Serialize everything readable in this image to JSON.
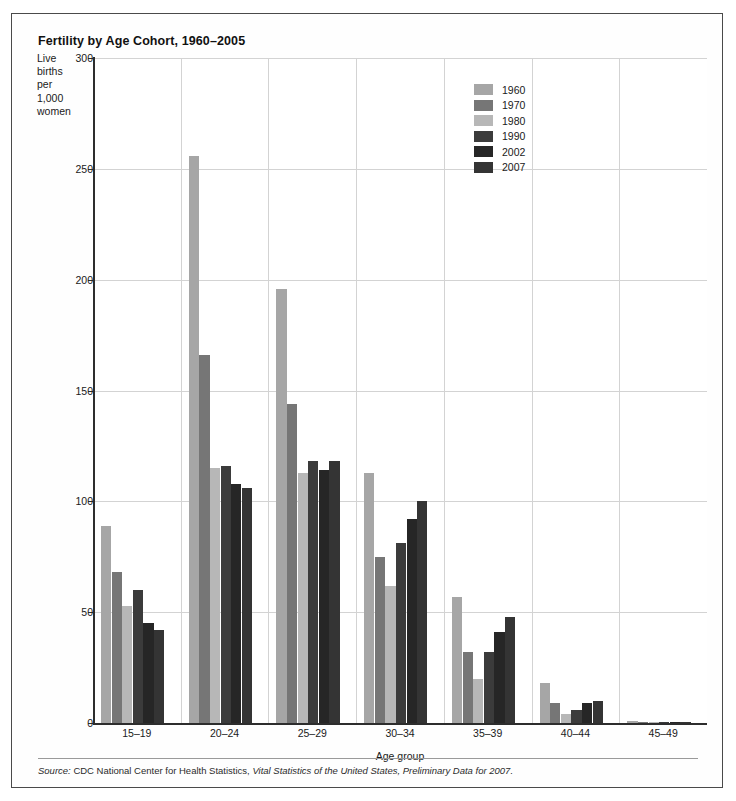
{
  "chart_title": "Fertility by Age Cohort, 1960–2005",
  "y_axis_caption": [
    "Live",
    "births",
    "per",
    "1,000",
    "women"
  ],
  "source_note": {
    "lead": "Source:",
    "rest_1": " CDC National Center for Health Statistics, ",
    "italic_1": "Vital Statistics of the United States, Preliminary Data for 2007.",
    "full": "Source: CDC National Center for Health Statistics, Vital Statistics of the United States, Preliminary Data for 2007."
  },
  "legend": {
    "position": "inside-top-right",
    "entries": [
      {
        "label": "1960",
        "color": "#a6a6a6"
      },
      {
        "label": "1970",
        "color": "#767676"
      },
      {
        "label": "1980",
        "color": "#b7b7b7"
      },
      {
        "label": "1990",
        "color": "#3b3b3b"
      },
      {
        "label": "2002",
        "color": "#262626"
      },
      {
        "label": "2007",
        "color": "#343434"
      }
    ]
  },
  "chart_data": {
    "type": "bar",
    "title": "Fertility by Age Cohort, 1960–2005",
    "subtitle": "",
    "xlabel": "Age group",
    "ylabel": "Live births per 1,000 women",
    "ylim": [
      0,
      300
    ],
    "yticks": [
      0,
      50,
      100,
      150,
      200,
      250,
      300
    ],
    "ytick_labels": [
      "0",
      "50",
      "100",
      "150",
      "200",
      "250",
      "300"
    ],
    "grid": "horizontal-and-vertical",
    "categories": [
      "15–19",
      "20–24",
      "25–29",
      "30–34",
      "35–39",
      "40–44",
      "45–49"
    ],
    "series": [
      {
        "name": "1960",
        "color": "#a6a6a6",
        "values": [
          89,
          256,
          196,
          113,
          57,
          18,
          1
        ]
      },
      {
        "name": "1970",
        "color": "#767676",
        "values": [
          68,
          166,
          144,
          75,
          32,
          9,
          0.5
        ]
      },
      {
        "name": "1980",
        "color": "#b7b7b7",
        "values": [
          53,
          115,
          113,
          62,
          20,
          4,
          0.3
        ]
      },
      {
        "name": "1990",
        "color": "#3b3b3b",
        "values": [
          60,
          116,
          118,
          81,
          32,
          6,
          0.3
        ]
      },
      {
        "name": "2002",
        "color": "#262626",
        "values": [
          45,
          108,
          114,
          92,
          41,
          9,
          0.5
        ]
      },
      {
        "name": "2007",
        "color": "#343434",
        "values": [
          42,
          106,
          118,
          100,
          48,
          10,
          0.6
        ]
      }
    ]
  }
}
